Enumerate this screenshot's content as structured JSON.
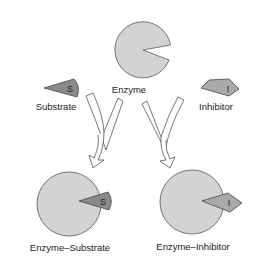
{
  "diagram": {
    "labels": {
      "enzyme": "Enzyme",
      "substrate": "Substrate",
      "inhibitor": "Inhibitor",
      "enzyme_substrate": "Enzyme–Substrate",
      "enzyme_inhibitor": "Enzyme–Inhibitor"
    },
    "glyphs": {
      "substrate": "S",
      "inhibitor": "I",
      "complex_substrate": "S",
      "complex_inhibitor": "I"
    },
    "colors": {
      "enzyme_fill": "#d3d3d3",
      "substrate_fill": "#8a8a8a",
      "inhibitor_fill": "#a9a9a9",
      "outline": "#555555",
      "arrow_fill": "#ffffff"
    }
  }
}
